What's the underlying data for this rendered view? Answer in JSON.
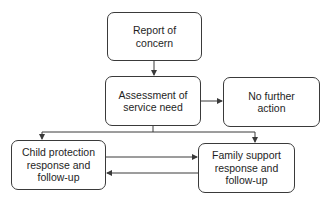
{
  "diagram": {
    "type": "flowchart",
    "nodes": [
      {
        "id": "report",
        "lines": [
          "Report of",
          "concern"
        ]
      },
      {
        "id": "assess",
        "lines": [
          "Assessment of",
          "service need"
        ]
      },
      {
        "id": "nofurther",
        "lines": [
          "No further",
          "action"
        ]
      },
      {
        "id": "child",
        "lines": [
          "Child protection",
          "response and",
          "follow-up"
        ]
      },
      {
        "id": "family",
        "lines": [
          "Family support",
          "response and",
          "follow-up"
        ]
      }
    ],
    "edges": [
      {
        "from": "report",
        "to": "assess"
      },
      {
        "from": "assess",
        "to": "nofurther"
      },
      {
        "from": "assess",
        "to": "child"
      },
      {
        "from": "assess",
        "to": "family"
      },
      {
        "from": "child",
        "to": "family"
      },
      {
        "from": "family",
        "to": "child"
      }
    ],
    "colors": {
      "stroke": "#3a3a3a",
      "text": "#1e1e1e",
      "background": "#ffffff"
    }
  }
}
